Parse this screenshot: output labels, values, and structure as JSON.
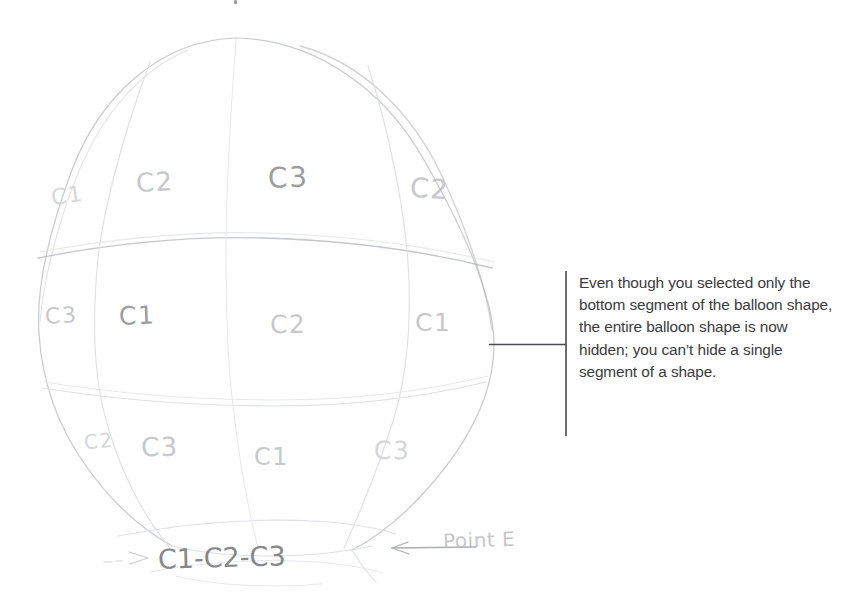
{
  "figure": {
    "background_color": "#ffffff"
  },
  "callout": {
    "text": "Even though you selected only the bottom segment of the balloon shape, the entire balloon shape is now hidden; you can’t hide a single segment of a shape.",
    "lines": [
      "Even though you selected",
      "only the bottom segment of",
      "the balloon shape, the entire",
      "balloon shape is now hidden;",
      "you can’t hide a single",
      "segment of a shape."
    ],
    "text_color": "#3b3b3d",
    "rule_color": "#4a4a4c"
  },
  "sketch": {
    "pencil_color": "#b8babe",
    "pencil_color_dark": "#8e9094",
    "rows": [
      {
        "name": "top-band",
        "labels": [
          "C1",
          "C2",
          "C3",
          "C2"
        ]
      },
      {
        "name": "middle-band",
        "labels": [
          "C3",
          "C1",
          "C2",
          "C1"
        ]
      },
      {
        "name": "lower-band",
        "labels": [
          "C2",
          "C3",
          "C1",
          "C3"
        ]
      }
    ],
    "bottom_annotation": "C1-C2-C3",
    "point_annotation": "Point E",
    "arrow_icon": "left-arrow"
  }
}
